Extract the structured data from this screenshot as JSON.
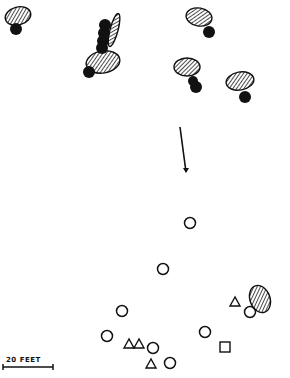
{
  "diagram": {
    "colors": {
      "ink": "#111111",
      "background": "#ffffff"
    },
    "legend_symbols": {
      "hatched-oval": "hatched blob",
      "filled-circle": "solid dot",
      "open-circle": "open circle",
      "open-triangle": "open triangle",
      "open-square": "open square"
    },
    "hatched_ovals": [
      {
        "cx": 18,
        "cy": 16,
        "rx": 13,
        "ry": 9,
        "rot": -15
      },
      {
        "cx": 114,
        "cy": 30,
        "rx": 4,
        "ry": 17,
        "rot": 15
      },
      {
        "cx": 103,
        "cy": 62,
        "rx": 17,
        "ry": 11,
        "rot": -10
      },
      {
        "cx": 199,
        "cy": 17,
        "rx": 13,
        "ry": 9,
        "rot": 10
      },
      {
        "cx": 187,
        "cy": 67,
        "rx": 13,
        "ry": 9,
        "rot": 0
      },
      {
        "cx": 240,
        "cy": 81,
        "rx": 14,
        "ry": 9,
        "rot": -10
      },
      {
        "cx": 260,
        "cy": 299,
        "rx": 10,
        "ry": 14,
        "rot": -20
      }
    ],
    "filled_circles": [
      {
        "cx": 16,
        "cy": 29,
        "r": 6
      },
      {
        "cx": 105,
        "cy": 25,
        "r": 6
      },
      {
        "cx": 104,
        "cy": 33,
        "r": 6
      },
      {
        "cx": 103,
        "cy": 41,
        "r": 6
      },
      {
        "cx": 102,
        "cy": 48,
        "r": 6
      },
      {
        "cx": 89,
        "cy": 72,
        "r": 6
      },
      {
        "cx": 209,
        "cy": 32,
        "r": 6
      },
      {
        "cx": 193,
        "cy": 81,
        "r": 5
      },
      {
        "cx": 196,
        "cy": 87,
        "r": 6
      },
      {
        "cx": 245,
        "cy": 97,
        "r": 6
      }
    ],
    "arrow": {
      "x1": 180,
      "y1": 127,
      "x2": 186,
      "y2": 172
    },
    "open_circles": [
      {
        "cx": 190,
        "cy": 223,
        "r": 5.5
      },
      {
        "cx": 163,
        "cy": 269,
        "r": 5.5
      },
      {
        "cx": 122,
        "cy": 311,
        "r": 5.5
      },
      {
        "cx": 107,
        "cy": 336,
        "r": 5.5
      },
      {
        "cx": 153,
        "cy": 348,
        "r": 5.5
      },
      {
        "cx": 170,
        "cy": 363,
        "r": 5.5
      },
      {
        "cx": 205,
        "cy": 332,
        "r": 5.5
      },
      {
        "cx": 250,
        "cy": 312,
        "r": 5.5
      }
    ],
    "open_triangles": [
      {
        "cx": 129,
        "cy": 344
      },
      {
        "cx": 139,
        "cy": 344
      },
      {
        "cx": 151,
        "cy": 364
      },
      {
        "cx": 235,
        "cy": 302
      }
    ],
    "open_squares": [
      {
        "x": 220,
        "y": 342,
        "size": 10
      }
    ],
    "scale_bar": {
      "label": "20 FEET",
      "x1": 3,
      "x2": 53,
      "y": 367
    }
  }
}
